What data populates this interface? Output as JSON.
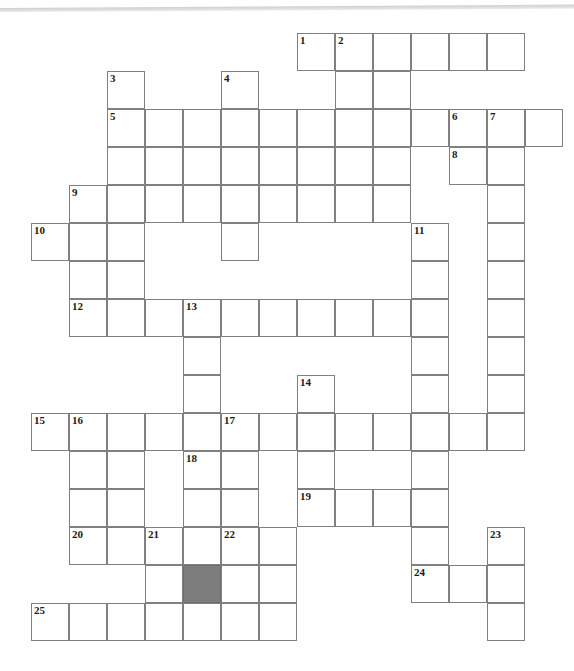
{
  "page": {
    "header_text": "",
    "background_color": "#ffffff"
  },
  "crossword": {
    "title": "",
    "grid": {
      "cell_size": 38,
      "origin_x": 31,
      "origin_y": 33,
      "columns": 14,
      "rows": 16,
      "border_color": "#808080",
      "cell_color": "#ffffff",
      "shaded_color": "#7d7d7d"
    },
    "clue_numbers": [
      1,
      2,
      3,
      4,
      5,
      6,
      7,
      8,
      9,
      10,
      11,
      12,
      13,
      14,
      15,
      16,
      17,
      18,
      19,
      20,
      21,
      22,
      23,
      24,
      25
    ],
    "cells": [
      {
        "c": 7,
        "r": 0,
        "n": "1"
      },
      {
        "c": 8,
        "r": 0,
        "n": "2"
      },
      {
        "c": 9,
        "r": 0,
        "n": ""
      },
      {
        "c": 10,
        "r": 0,
        "n": ""
      },
      {
        "c": 11,
        "r": 0,
        "n": ""
      },
      {
        "c": 12,
        "r": 0,
        "n": ""
      },
      {
        "c": 2,
        "r": 1,
        "n": "3"
      },
      {
        "c": 5,
        "r": 1,
        "n": "4"
      },
      {
        "c": 8,
        "r": 1,
        "n": ""
      },
      {
        "c": 9,
        "r": 1,
        "n": ""
      },
      {
        "c": 2,
        "r": 2,
        "n": "5"
      },
      {
        "c": 3,
        "r": 2,
        "n": ""
      },
      {
        "c": 4,
        "r": 2,
        "n": ""
      },
      {
        "c": 5,
        "r": 2,
        "n": ""
      },
      {
        "c": 6,
        "r": 2,
        "n": ""
      },
      {
        "c": 7,
        "r": 2,
        "n": ""
      },
      {
        "c": 8,
        "r": 2,
        "n": ""
      },
      {
        "c": 9,
        "r": 2,
        "n": ""
      },
      {
        "c": 10,
        "r": 2,
        "n": ""
      },
      {
        "c": 11,
        "r": 2,
        "n": "6"
      },
      {
        "c": 12,
        "r": 2,
        "n": "7"
      },
      {
        "c": 13,
        "r": 2,
        "n": ""
      },
      {
        "c": 2,
        "r": 3,
        "n": ""
      },
      {
        "c": 3,
        "r": 3,
        "n": ""
      },
      {
        "c": 4,
        "r": 3,
        "n": ""
      },
      {
        "c": 5,
        "r": 3,
        "n": ""
      },
      {
        "c": 6,
        "r": 3,
        "n": ""
      },
      {
        "c": 7,
        "r": 3,
        "n": ""
      },
      {
        "c": 8,
        "r": 3,
        "n": ""
      },
      {
        "c": 9,
        "r": 3,
        "n": ""
      },
      {
        "c": 11,
        "r": 3,
        "n": "8"
      },
      {
        "c": 12,
        "r": 3,
        "n": ""
      },
      {
        "c": 1,
        "r": 4,
        "n": "9"
      },
      {
        "c": 2,
        "r": 4,
        "n": ""
      },
      {
        "c": 3,
        "r": 4,
        "n": ""
      },
      {
        "c": 4,
        "r": 4,
        "n": ""
      },
      {
        "c": 5,
        "r": 4,
        "n": ""
      },
      {
        "c": 6,
        "r": 4,
        "n": ""
      },
      {
        "c": 7,
        "r": 4,
        "n": ""
      },
      {
        "c": 8,
        "r": 4,
        "n": ""
      },
      {
        "c": 9,
        "r": 4,
        "n": ""
      },
      {
        "c": 12,
        "r": 4,
        "n": ""
      },
      {
        "c": 0,
        "r": 5,
        "n": "10"
      },
      {
        "c": 1,
        "r": 5,
        "n": ""
      },
      {
        "c": 2,
        "r": 5,
        "n": ""
      },
      {
        "c": 5,
        "r": 5,
        "n": ""
      },
      {
        "c": 10,
        "r": 5,
        "n": "11"
      },
      {
        "c": 12,
        "r": 5,
        "n": ""
      },
      {
        "c": 1,
        "r": 6,
        "n": ""
      },
      {
        "c": 2,
        "r": 6,
        "n": ""
      },
      {
        "c": 10,
        "r": 6,
        "n": ""
      },
      {
        "c": 12,
        "r": 6,
        "n": ""
      },
      {
        "c": 1,
        "r": 7,
        "n": "12"
      },
      {
        "c": 2,
        "r": 7,
        "n": ""
      },
      {
        "c": 3,
        "r": 7,
        "n": ""
      },
      {
        "c": 4,
        "r": 7,
        "n": "13"
      },
      {
        "c": 5,
        "r": 7,
        "n": ""
      },
      {
        "c": 6,
        "r": 7,
        "n": ""
      },
      {
        "c": 7,
        "r": 7,
        "n": ""
      },
      {
        "c": 8,
        "r": 7,
        "n": ""
      },
      {
        "c": 9,
        "r": 7,
        "n": ""
      },
      {
        "c": 10,
        "r": 7,
        "n": ""
      },
      {
        "c": 12,
        "r": 7,
        "n": ""
      },
      {
        "c": 4,
        "r": 8,
        "n": ""
      },
      {
        "c": 10,
        "r": 8,
        "n": ""
      },
      {
        "c": 12,
        "r": 8,
        "n": ""
      },
      {
        "c": 4,
        "r": 9,
        "n": ""
      },
      {
        "c": 7,
        "r": 9,
        "n": "14"
      },
      {
        "c": 10,
        "r": 9,
        "n": ""
      },
      {
        "c": 12,
        "r": 9,
        "n": ""
      },
      {
        "c": 0,
        "r": 10,
        "n": "15"
      },
      {
        "c": 1,
        "r": 10,
        "n": "16"
      },
      {
        "c": 2,
        "r": 10,
        "n": ""
      },
      {
        "c": 3,
        "r": 10,
        "n": ""
      },
      {
        "c": 4,
        "r": 10,
        "n": ""
      },
      {
        "c": 5,
        "r": 10,
        "n": "17"
      },
      {
        "c": 6,
        "r": 10,
        "n": ""
      },
      {
        "c": 7,
        "r": 10,
        "n": ""
      },
      {
        "c": 8,
        "r": 10,
        "n": ""
      },
      {
        "c": 9,
        "r": 10,
        "n": ""
      },
      {
        "c": 10,
        "r": 10,
        "n": ""
      },
      {
        "c": 11,
        "r": 10,
        "n": ""
      },
      {
        "c": 12,
        "r": 10,
        "n": ""
      },
      {
        "c": 1,
        "r": 11,
        "n": ""
      },
      {
        "c": 2,
        "r": 11,
        "n": ""
      },
      {
        "c": 4,
        "r": 11,
        "n": "18"
      },
      {
        "c": 5,
        "r": 11,
        "n": ""
      },
      {
        "c": 7,
        "r": 11,
        "n": ""
      },
      {
        "c": 10,
        "r": 11,
        "n": ""
      },
      {
        "c": 1,
        "r": 12,
        "n": ""
      },
      {
        "c": 2,
        "r": 12,
        "n": ""
      },
      {
        "c": 4,
        "r": 12,
        "n": ""
      },
      {
        "c": 5,
        "r": 12,
        "n": ""
      },
      {
        "c": 7,
        "r": 12,
        "n": "19"
      },
      {
        "c": 8,
        "r": 12,
        "n": ""
      },
      {
        "c": 9,
        "r": 12,
        "n": ""
      },
      {
        "c": 10,
        "r": 12,
        "n": ""
      },
      {
        "c": 1,
        "r": 13,
        "n": "20"
      },
      {
        "c": 2,
        "r": 13,
        "n": ""
      },
      {
        "c": 3,
        "r": 13,
        "n": "21"
      },
      {
        "c": 4,
        "r": 13,
        "n": ""
      },
      {
        "c": 5,
        "r": 13,
        "n": "22"
      },
      {
        "c": 6,
        "r": 13,
        "n": ""
      },
      {
        "c": 10,
        "r": 13,
        "n": ""
      },
      {
        "c": 12,
        "r": 13,
        "n": "23"
      },
      {
        "c": 3,
        "r": 14,
        "n": ""
      },
      {
        "c": 4,
        "r": 14,
        "n": "",
        "shaded": true
      },
      {
        "c": 5,
        "r": 14,
        "n": ""
      },
      {
        "c": 6,
        "r": 14,
        "n": ""
      },
      {
        "c": 10,
        "r": 14,
        "n": "24"
      },
      {
        "c": 11,
        "r": 14,
        "n": ""
      },
      {
        "c": 12,
        "r": 14,
        "n": ""
      },
      {
        "c": 0,
        "r": 15,
        "n": "25"
      },
      {
        "c": 1,
        "r": 15,
        "n": ""
      },
      {
        "c": 2,
        "r": 15,
        "n": ""
      },
      {
        "c": 3,
        "r": 15,
        "n": ""
      },
      {
        "c": 4,
        "r": 15,
        "n": ""
      },
      {
        "c": 5,
        "r": 15,
        "n": ""
      },
      {
        "c": 6,
        "r": 15,
        "n": ""
      },
      {
        "c": 12,
        "r": 15,
        "n": ""
      }
    ]
  }
}
